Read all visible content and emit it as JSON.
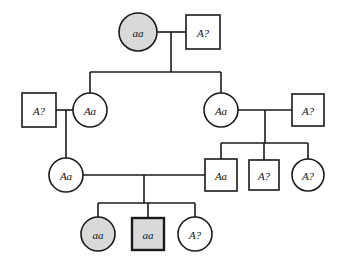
{
  "diagram": {
    "type": "pedigree-chart",
    "title": "",
    "canvas": {
      "width": 338,
      "height": 269
    },
    "colors": {
      "background": "#ffffff",
      "stroke": "#1a1a1a",
      "unaffected_fill": "#ffffff",
      "affected_fill": "#d9d9d9",
      "text": "#111111"
    },
    "legend_note": ""
  },
  "individuals": [
    {
      "id": "I-1",
      "label": "aa",
      "sex": "female",
      "shape": "circle",
      "affected": true,
      "fill": "#d9d9d9",
      "thick_border": false,
      "generation": 1,
      "cx": 138,
      "cy": 32,
      "r": 19
    },
    {
      "id": "I-2",
      "label": "A?",
      "sex": "male",
      "shape": "square",
      "affected": false,
      "fill": "#ffffff",
      "thick_border": false,
      "generation": 1,
      "cx": 203,
      "cy": 32,
      "size": 34
    },
    {
      "id": "II-1",
      "label": "A?",
      "sex": "male",
      "shape": "square",
      "affected": false,
      "fill": "#ffffff",
      "thick_border": false,
      "generation": 2,
      "cx": 39,
      "cy": 110,
      "size": 34
    },
    {
      "id": "II-2",
      "label": "Aa",
      "sex": "female",
      "shape": "circle",
      "affected": false,
      "fill": "#ffffff",
      "thick_border": false,
      "generation": 2,
      "cx": 90,
      "cy": 110,
      "r": 17
    },
    {
      "id": "II-3",
      "label": "Aa",
      "sex": "female",
      "shape": "circle",
      "affected": false,
      "fill": "#ffffff",
      "thick_border": false,
      "generation": 2,
      "cx": 221,
      "cy": 110,
      "r": 17
    },
    {
      "id": "II-4",
      "label": "A?",
      "sex": "male",
      "shape": "square",
      "affected": false,
      "fill": "#ffffff",
      "thick_border": false,
      "generation": 2,
      "cx": 308,
      "cy": 110,
      "size": 32
    },
    {
      "id": "III-1",
      "label": "Aa",
      "sex": "female",
      "shape": "circle",
      "affected": false,
      "fill": "#ffffff",
      "thick_border": false,
      "generation": 3,
      "cx": 66,
      "cy": 175,
      "r": 17
    },
    {
      "id": "III-2",
      "label": "Aa",
      "sex": "male",
      "shape": "square",
      "affected": false,
      "fill": "#ffffff",
      "thick_border": false,
      "generation": 3,
      "cx": 221,
      "cy": 175,
      "size": 32
    },
    {
      "id": "III-3",
      "label": "A?",
      "sex": "male",
      "shape": "square",
      "affected": false,
      "fill": "#ffffff",
      "thick_border": false,
      "generation": 3,
      "cx": 264,
      "cy": 175,
      "size": 30
    },
    {
      "id": "III-4",
      "label": "A?",
      "sex": "female",
      "shape": "circle",
      "affected": false,
      "fill": "#ffffff",
      "thick_border": false,
      "generation": 3,
      "cx": 308,
      "cy": 175,
      "r": 16
    },
    {
      "id": "IV-1",
      "label": "aa",
      "sex": "female",
      "shape": "circle",
      "affected": true,
      "fill": "#d9d9d9",
      "thick_border": false,
      "generation": 4,
      "cx": 98,
      "cy": 234,
      "r": 17
    },
    {
      "id": "IV-2",
      "label": "aa",
      "sex": "male",
      "shape": "square",
      "affected": true,
      "fill": "#d9d9d9",
      "thick_border": true,
      "generation": 4,
      "cx": 148,
      "cy": 234,
      "size": 32
    },
    {
      "id": "IV-3",
      "label": "A?",
      "sex": "female",
      "shape": "circle",
      "affected": false,
      "fill": "#ffffff",
      "thick_border": false,
      "generation": 4,
      "cx": 195,
      "cy": 234,
      "r": 17
    }
  ],
  "connectors": [
    {
      "name": "mating-line-gen1",
      "points": "157,32 186,32"
    },
    {
      "name": "descent-drop-gen1",
      "points": "171,32 171,72"
    },
    {
      "name": "sibship-line-gen2",
      "points": "90,72 221,72"
    },
    {
      "name": "sibship-stub-II-2",
      "points": "90,72 90,93"
    },
    {
      "name": "sibship-stub-II-3",
      "points": "221,72 221,93"
    },
    {
      "name": "mating-line-gen2-left",
      "points": "56,110 73,110"
    },
    {
      "name": "descent-drop-gen2-left",
      "points": "66,110 66,158"
    },
    {
      "name": "mating-line-gen2-right",
      "points": "238,110 292,110"
    },
    {
      "name": "descent-drop-gen2-right",
      "points": "265,110 265,143"
    },
    {
      "name": "sibship-line-gen3",
      "points": "221,143 308,143"
    },
    {
      "name": "sibship-stub-III-2",
      "points": "221,143 221,159"
    },
    {
      "name": "sibship-stub-III-3",
      "points": "264,143 264,160"
    },
    {
      "name": "sibship-stub-III-4",
      "points": "308,143 308,159"
    },
    {
      "name": "mating-line-gen3",
      "points": "83,175 205,175"
    },
    {
      "name": "descent-drop-gen3",
      "points": "144,175 144,203"
    },
    {
      "name": "sibship-line-gen4",
      "points": "98,203 195,203"
    },
    {
      "name": "sibship-stub-IV-1",
      "points": "98,203 98,217"
    },
    {
      "name": "sibship-stub-IV-2",
      "points": "148,203 148,218"
    },
    {
      "name": "sibship-stub-IV-3",
      "points": "195,203 195,217"
    }
  ]
}
